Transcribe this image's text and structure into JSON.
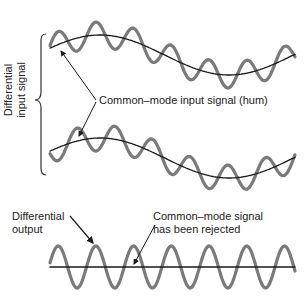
{
  "diagram": {
    "labels": {
      "differential_input_line1": "Differential",
      "differential_input_line2": "input signal",
      "common_mode_input": "Common–mode input signal (hum)",
      "differential_output_line1": "Differential",
      "differential_output_line2": "output",
      "rejected_line1": "Common–mode signal",
      "rejected_line2": "has been rejected"
    },
    "colors": {
      "signal": "#7a7a7a",
      "hum": "#1a1a1a",
      "text": "#222222"
    },
    "panels": [
      {
        "name": "input-a",
        "hum_phase": "positive",
        "signal": "sine"
      },
      {
        "name": "input-b",
        "hum_phase": "positive",
        "signal": "inverted sine"
      },
      {
        "name": "output",
        "hum_phase": "none",
        "signal": "sine"
      }
    ]
  }
}
